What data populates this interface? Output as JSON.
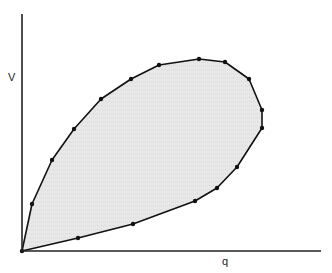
{
  "diagram": {
    "axes": {
      "y_label": "V",
      "x_label": "q",
      "origin": [
        22,
        251
      ],
      "y_axis_top": [
        22,
        14
      ],
      "x_axis_right": [
        321,
        251
      ]
    },
    "region": {
      "fill_color": "#e6e6e6",
      "stroke_color": "#111111",
      "vertices": [
        [
          22,
          251
        ],
        [
          32,
          204
        ],
        [
          52,
          160
        ],
        [
          74,
          129
        ],
        [
          101,
          99
        ],
        [
          131,
          79
        ],
        [
          159,
          65
        ],
        [
          199,
          59
        ],
        [
          225,
          62
        ],
        [
          249,
          79
        ],
        [
          262,
          110
        ],
        [
          262,
          128
        ],
        [
          237,
          167
        ],
        [
          217,
          188
        ],
        [
          195,
          201
        ],
        [
          133,
          224
        ],
        [
          78,
          238
        ]
      ]
    }
  }
}
